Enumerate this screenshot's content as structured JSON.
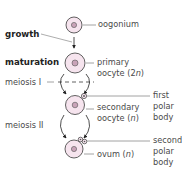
{
  "diagram": {
    "colors": {
      "cell_fill": "#f6e4ee",
      "cell_stroke": "#3a3a3a",
      "nucleus_fill": "#c9a3b8",
      "text": "#4a4a4a",
      "leader_line": "#8a8a8a"
    },
    "stages": {
      "growth": "growth",
      "maturation": "maturation",
      "meiosis_1": "meiosis I",
      "meiosis_2": "meiosis II"
    },
    "cells": {
      "oogonium": {
        "label": "oogonium"
      },
      "primary_oocyte": {
        "label_line1": "primary",
        "label_line2_prefix": "oocyte (2",
        "label_line2_n": "n",
        "label_line2_suffix": ")"
      },
      "secondary_oocyte": {
        "label_line1": "secondary",
        "label_line2_prefix": "oocyte (",
        "label_line2_n": "n",
        "label_line2_suffix": ")"
      },
      "ovum": {
        "label_prefix": "ovum (",
        "label_n": "n",
        "label_suffix": ")"
      }
    },
    "polar_bodies": {
      "first": {
        "line1": "first",
        "line2": "polar",
        "line3": "body"
      },
      "second": {
        "line1": "second",
        "line2": "polar",
        "line3": "body"
      }
    }
  }
}
